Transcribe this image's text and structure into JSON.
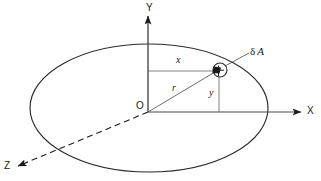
{
  "figure": {
    "background_color": "#ffffff",
    "line_color": "#1a1a1a",
    "width": 321,
    "height": 181
  },
  "axes": [
    {
      "id": "y-axis",
      "label": "Y",
      "direction": "up",
      "arrow": true,
      "style": "solid",
      "from": [
        148,
        112
      ],
      "to": [
        148,
        16
      ]
    },
    {
      "id": "x-axis",
      "label": "X",
      "direction": "right",
      "arrow": true,
      "style": "solid",
      "from": [
        148,
        112
      ],
      "to": [
        301,
        112
      ]
    },
    {
      "id": "z-axis",
      "label": "Z",
      "direction": "down-left",
      "arrow": true,
      "style": "dashed",
      "from": [
        148,
        112
      ],
      "to": [
        18,
        166
      ]
    }
  ],
  "origin": {
    "label": "O",
    "position": [
      148,
      112
    ]
  },
  "plane": {
    "name": "ellipse-plane",
    "center": [
      149,
      108
    ],
    "radius_x": 119,
    "radius_y": 64,
    "style": "solid"
  },
  "point": {
    "name": "element-point",
    "position": [
      219,
      70
    ],
    "marker_radius": 7,
    "label": "δ A",
    "label_delta": "δ",
    "label_a": "A",
    "leader_from": [
      226,
      65
    ],
    "leader_to": [
      249,
      52
    ]
  },
  "dimensions": [
    {
      "id": "x-dimension",
      "label": "x",
      "orientation": "horizontal",
      "from": [
        148,
        71
      ],
      "to": [
        219,
        71
      ]
    },
    {
      "id": "y-dimension",
      "label": "y",
      "orientation": "vertical",
      "from": [
        219,
        71
      ],
      "to": [
        219,
        112
      ]
    },
    {
      "id": "r-dimension",
      "label": "r",
      "orientation": "radial",
      "from": [
        148,
        112
      ],
      "to": [
        219,
        70
      ]
    }
  ],
  "labels": {
    "y_axis": "Y",
    "x_axis": "X",
    "z_axis": "Z",
    "origin": "O",
    "x_distance": "x",
    "y_distance": "y",
    "radius": "r",
    "area_element": "δ A"
  }
}
